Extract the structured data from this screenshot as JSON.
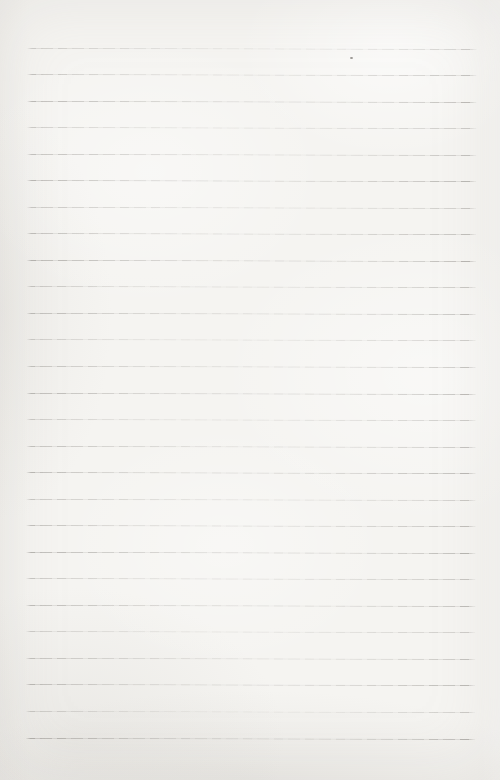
{
  "page": {
    "text_content": "",
    "background_color": "#f5f4f1",
    "rule_color": "#807d78",
    "ruled_lines": {
      "count": 27,
      "first_y": 47.5,
      "spacing": 26.54,
      "start_x": 27,
      "end_x": 477,
      "thickness": 1
    },
    "speck": {
      "x": 350,
      "y": 57
    }
  }
}
